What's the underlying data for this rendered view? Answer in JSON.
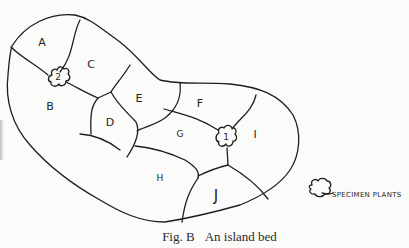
{
  "figure": {
    "caption_number": "Fig. B",
    "caption_text": "An island bed",
    "regions": [
      {
        "id": "A",
        "label": "A"
      },
      {
        "id": "B",
        "label": "B"
      },
      {
        "id": "C",
        "label": "C"
      },
      {
        "id": "D",
        "label": "D"
      },
      {
        "id": "E",
        "label": "E"
      },
      {
        "id": "F",
        "label": "F"
      },
      {
        "id": "G",
        "label": "G"
      },
      {
        "id": "H",
        "label": "H"
      },
      {
        "id": "I",
        "label": "I"
      },
      {
        "id": "J",
        "label": "J"
      }
    ],
    "specimen_plants": [
      {
        "id": "1",
        "label": "1"
      },
      {
        "id": "2",
        "label": "2"
      }
    ],
    "legend": {
      "label": "SPECIMEN PLANTS",
      "icon": "shrub-icon"
    },
    "colors": {
      "ink": "#1e1e1e",
      "paper": "#fbfbfa"
    }
  }
}
